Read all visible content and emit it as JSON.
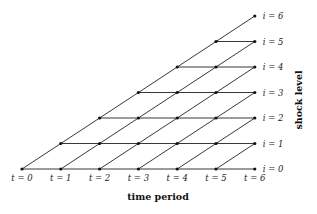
{
  "diagram": {
    "type": "lattice",
    "x_axis_title": "time period",
    "y_axis_title": "shock level",
    "time_labels": [
      "t = 0",
      "t = 1",
      "t = 2",
      "t = 3",
      "t = 4",
      "t = 5",
      "t = 6"
    ],
    "level_labels": [
      "i = 0",
      "i = 1",
      "i = 2",
      "i = 3",
      "i = 4",
      "i = 5",
      "i = 6"
    ],
    "periods": 6,
    "line_color": "#222222",
    "node_color": "#111111"
  }
}
